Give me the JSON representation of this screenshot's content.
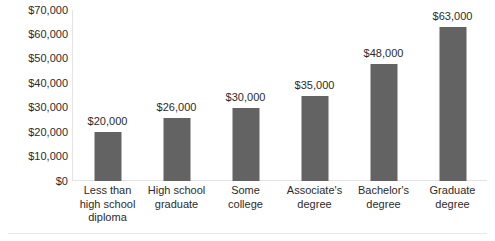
{
  "chart_data": {
    "type": "bar",
    "title": "",
    "xlabel": "",
    "ylabel": "",
    "categories": [
      "Less than high school diploma",
      "High school graduate",
      "Some college",
      "Associate's degree",
      "Bachelor's degree",
      "Graduate degree"
    ],
    "category_lines": [
      [
        "Less than",
        "high school",
        "diploma"
      ],
      [
        "High school",
        "graduate"
      ],
      [
        "Some",
        "college"
      ],
      [
        "Associate's",
        "degree"
      ],
      [
        "Bachelor's",
        "degree"
      ],
      [
        "Graduate",
        "degree"
      ]
    ],
    "values": [
      20000,
      26000,
      30000,
      35000,
      48000,
      63000
    ],
    "value_labels": [
      "$20,000",
      "$26,000",
      "$30,000",
      "$35,000",
      "$48,000",
      "$63,000"
    ],
    "ylim": [
      0,
      70000
    ],
    "ytick_values": [
      70000,
      60000,
      50000,
      40000,
      30000,
      20000,
      10000,
      0
    ],
    "ytick_labels": [
      "$70,000",
      "$60,000",
      "$50,000",
      "$40,000",
      "$30,000",
      "$20,000",
      "$10,000",
      "$0"
    ],
    "grid": false,
    "legend": false,
    "bar_color": "#636363",
    "axis_color": "#e4e4e4",
    "text_color": "#2b2b2b",
    "background": "#ffffff"
  }
}
